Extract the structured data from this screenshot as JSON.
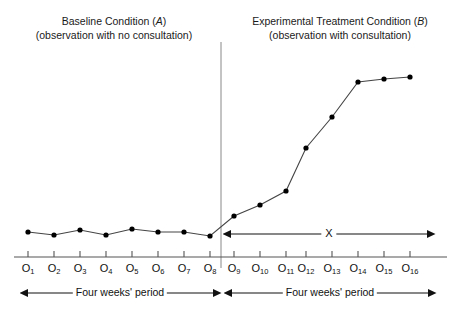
{
  "figure": {
    "width": 459,
    "height": 310,
    "background": "#ffffff",
    "line_color": "#444444",
    "marker_color": "#000000",
    "axis_color": "#555555",
    "divider_color": "#777777"
  },
  "phases": {
    "baseline": {
      "title_line1": "Baseline Condition (A)",
      "title_line2": "(observation with no consultation)",
      "italic_letter": "A",
      "span_label": "Four weeks' period"
    },
    "experimental": {
      "title_line1": "Experimental Treatment Condition (B)",
      "title_line2": "(observation with consultation)",
      "italic_letter": "B",
      "span_label": "Four weeks' period",
      "treatment_marker": "X"
    }
  },
  "chart_data": {
    "type": "line",
    "title": "",
    "subtitle": "",
    "xlabel": "",
    "ylabel": "",
    "grid": false,
    "legend": "none",
    "xlim": [
      0.5,
      16.5
    ],
    "ylim": [
      0,
      10
    ],
    "annotations": [
      {
        "name": "phase-divider",
        "type": "vline",
        "x": 8.5
      },
      {
        "name": "treatment-span",
        "type": "double-arrow",
        "label": "X",
        "x_start": 9,
        "x_end": 16
      },
      {
        "name": "baseline-period",
        "type": "double-arrow",
        "label": "Four weeks' period",
        "x_start": 1,
        "x_end": 8
      },
      {
        "name": "treatment-period",
        "type": "double-arrow",
        "label": "Four weeks' period",
        "x_start": 9,
        "x_end": 16
      }
    ],
    "categories": [
      "O1",
      "O2",
      "O3",
      "O4",
      "O5",
      "O6",
      "O7",
      "O8",
      "O9",
      "O10",
      "O11",
      "O12",
      "O13",
      "O14",
      "O15",
      "O16"
    ],
    "tick_labels": [
      "O1",
      "O2",
      "O3",
      "O4",
      "O5",
      "O6",
      "O7",
      "O8",
      "O9",
      "O10",
      "O11",
      "O12",
      "O13",
      "O14",
      "O15",
      "O16"
    ],
    "tick_bases": [
      "O",
      "O",
      "O",
      "O",
      "O",
      "O",
      "O",
      "O",
      "O",
      "O",
      "O",
      "O",
      "O",
      "O",
      "O",
      "O"
    ],
    "tick_subs": [
      "1",
      "2",
      "3",
      "4",
      "5",
      "6",
      "7",
      "8",
      "9",
      "10",
      "11",
      "12",
      "13",
      "14",
      "15",
      "16"
    ],
    "series": [
      {
        "name": "observations",
        "x": [
          1,
          2,
          3,
          4,
          5,
          6,
          7,
          8,
          9,
          10,
          11,
          12,
          13,
          14,
          15,
          16
        ],
        "values": [
          0.6,
          0.3,
          0.8,
          0.3,
          0.9,
          0.6,
          0.6,
          0.2,
          2.2,
          3.3,
          4.7,
          8.9,
          12.0,
          15.5,
          15.8,
          16.0
        ],
        "pixel_points": [
          [
            28,
            232
          ],
          [
            54,
            235
          ],
          [
            80,
            230
          ],
          [
            106,
            235
          ],
          [
            132,
            229
          ],
          [
            158,
            232
          ],
          [
            184,
            232
          ],
          [
            210,
            236
          ],
          [
            234,
            216
          ],
          [
            260,
            205
          ],
          [
            286,
            191
          ],
          [
            306,
            148
          ],
          [
            332,
            117
          ],
          [
            358,
            82
          ],
          [
            384,
            79
          ],
          [
            410,
            77
          ]
        ]
      }
    ]
  }
}
